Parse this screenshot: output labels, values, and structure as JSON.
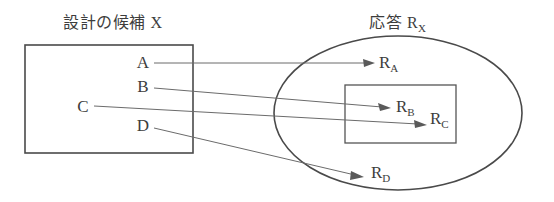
{
  "diagram": {
    "type": "set-mapping-diagram",
    "stroke_color": "#4a4a4a",
    "connector_color": "#6b6b6b",
    "text_color": "#3d3d3d",
    "background_color": "#ffffff",
    "left_group": {
      "title": "設計の候補 X",
      "shape": "rectangle",
      "nodes": [
        {
          "id": "A",
          "label": "A"
        },
        {
          "id": "B",
          "label": "B"
        },
        {
          "id": "C",
          "label": "C"
        },
        {
          "id": "D",
          "label": "D"
        }
      ]
    },
    "right_group": {
      "title_main": "応答 R",
      "title_sub": "X",
      "shape": "ellipse",
      "inner_shape": "rectangle",
      "nodes": [
        {
          "id": "RA",
          "base": "R",
          "sub": "A",
          "inside_inner_rect": false
        },
        {
          "id": "RB",
          "base": "R",
          "sub": "B",
          "inside_inner_rect": true
        },
        {
          "id": "RC",
          "base": "R",
          "sub": "C",
          "inside_inner_rect": true
        },
        {
          "id": "RD",
          "base": "R",
          "sub": "D",
          "inside_inner_rect": false
        }
      ]
    },
    "mappings": [
      {
        "from": "A",
        "to": "RA"
      },
      {
        "from": "B",
        "to": "RB"
      },
      {
        "from": "C",
        "to": "RC"
      },
      {
        "from": "D",
        "to": "RD"
      }
    ]
  }
}
